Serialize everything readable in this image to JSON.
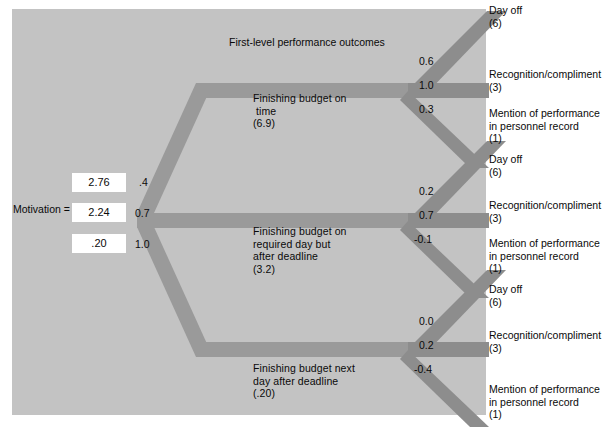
{
  "diagram": {
    "heading": "First-level performance outcomes",
    "motivation_label": "Motivation =",
    "motivation_values": [
      "2.76",
      "2.24",
      ".20"
    ],
    "expectancies": [
      ".4",
      "0.7",
      "1.0"
    ],
    "performance_outcomes": [
      {
        "name": "Finishing budget on\n time\n(6.9)",
        "valence": "(6.9)"
      },
      {
        "name": "Finishing budget on\nrequired day but\nafter deadline\n(3.2)",
        "valence": "(3.2)"
      },
      {
        "name": "Finishing budget next\nday after deadline\n(.20)",
        "valence": "(.20)"
      }
    ],
    "instrumentality_groups": [
      [
        "0.6",
        "1.0",
        "0.3"
      ],
      [
        "0.2",
        "0.7",
        "-0.1"
      ],
      [
        "0.0",
        "0.2",
        "-0.4"
      ]
    ],
    "second_level_outcomes": [
      [
        "Day off\n(6)",
        "Recognition/compliment\n(3)",
        "Mention of performance\nin personnel record\n(1)"
      ],
      [
        "Day off\n(6)",
        "Recognition/compliment\n(3)",
        "Mention of performance\nin personnel record\n(1)"
      ],
      [
        "Day off\n(6)",
        "Recognition/compliment\n(3)",
        "Mention of performance\nin personnel record\n(1)"
      ]
    ],
    "colors": {
      "panel_background": "#c3c3c3",
      "ribbon": "#9a9a9a",
      "ribbon_dark": "#8d8d8d",
      "value_box": "#ffffff",
      "text": "#0a0a0a"
    }
  }
}
